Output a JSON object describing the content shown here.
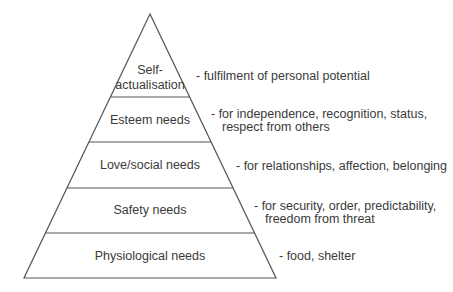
{
  "diagram": {
    "type": "pyramid",
    "title": "",
    "levels": [
      {
        "label": "Self-\nactualisation",
        "label_line1": "Self-",
        "label_line2": "actualisation",
        "desc_line1": "-  fulfilment of personal potential",
        "desc_line2": ""
      },
      {
        "label": "Esteem needs",
        "desc_line1": "-  for independence, recognition, status,",
        "desc_line2": "respect from others"
      },
      {
        "label": "Love/social needs",
        "desc_line1": "-  for relationships, affection, belonging",
        "desc_line2": ""
      },
      {
        "label": "Safety needs",
        "desc_line1": "-  for security, order, predictability,",
        "desc_line2": "freedom from threat"
      },
      {
        "label": "Physiological needs",
        "desc_line1": "-  food, shelter",
        "desc_line2": ""
      }
    ],
    "colors": {
      "line": "#555555",
      "text": "#3a3a3a",
      "background": "#ffffff"
    }
  }
}
